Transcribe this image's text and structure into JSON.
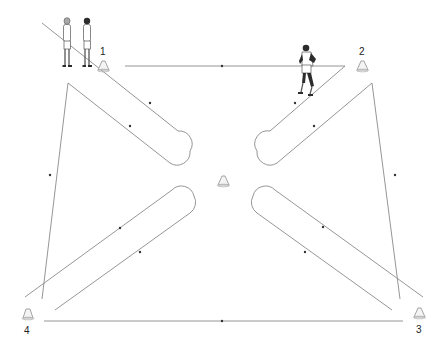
{
  "diagram": {
    "title": "",
    "type": "drill-layout",
    "colors": {
      "path_stroke": "#8a8a8a",
      "direction_dot": "#333333",
      "cone_fill": "#f4f4f4",
      "cone_stroke": "#9a9a9a",
      "label": "#222222"
    },
    "cones": [
      {
        "id": "cone-1",
        "label": "1",
        "x": 103,
        "y": 66
      },
      {
        "id": "cone-2",
        "label": "2",
        "x": 362,
        "y": 66
      },
      {
        "id": "cone-3",
        "label": "3",
        "x": 420,
        "y": 313
      },
      {
        "id": "cone-4",
        "label": "4",
        "x": 28,
        "y": 313
      },
      {
        "id": "cone-center",
        "label": "",
        "x": 224,
        "y": 181
      }
    ],
    "players": [
      {
        "id": "player-waiting-1",
        "role": "waiting",
        "x": 67,
        "y": 40
      },
      {
        "id": "player-waiting-2",
        "role": "waiting",
        "x": 87,
        "y": 40
      },
      {
        "id": "player-running",
        "role": "running",
        "x": 307,
        "y": 70
      }
    ],
    "paths": [
      {
        "id": "path-start-diagonal",
        "description": "from start area diagonal to top-left loop"
      },
      {
        "id": "path-top-line",
        "description": "cone 1 to cone 2 horizontal"
      },
      {
        "id": "path-bottom-line",
        "description": "cone 4 to cone 3 horizontal"
      },
      {
        "id": "loop-top-left"
      },
      {
        "id": "loop-top-right"
      },
      {
        "id": "loop-bottom-left"
      },
      {
        "id": "loop-bottom-right"
      }
    ]
  }
}
